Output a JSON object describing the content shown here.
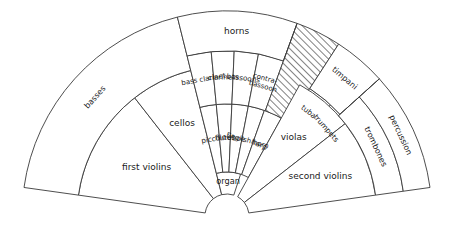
{
  "figure": {
    "type": "fan-diagram",
    "background_color": "#ffffff",
    "stroke_color": "#3a3a3a",
    "label_color": "#1a1a1a",
    "hatch_color": "#1a1a1a"
  },
  "geometry": {
    "center_x": 227,
    "center_y": 216,
    "inner_radius": 22,
    "outer_radius": 205,
    "start_angle_deg": 188,
    "end_angle_deg": 352
  },
  "sections": [
    {
      "name": "first-violins",
      "label": "first violins",
      "r0": 22,
      "r1": 150,
      "a0": 188,
      "a1": 232,
      "font_size": 9.0,
      "rotate": false,
      "hatched": false,
      "label_r": 0.56,
      "label_a": 0.52
    },
    {
      "name": "cellos",
      "label": "cellos",
      "r0": 22,
      "r1": 150,
      "a0": 232,
      "a1": 256,
      "font_size": 9.0,
      "rotate": false,
      "hatched": false,
      "label_r": 0.63,
      "label_a": 0.5
    },
    {
      "name": "basses",
      "label": "basses",
      "r0": 150,
      "r1": 205,
      "a0": 188,
      "a1": 256,
      "font_size": 8.0,
      "rotate": true,
      "hatched": false,
      "label_r": 0.5,
      "label_a": 0.5
    },
    {
      "name": "organ",
      "label": "organ",
      "r0": 22,
      "r1": 44,
      "a0": 256,
      "a1": 288,
      "font_size": 8.2,
      "rotate": false,
      "hatched": false,
      "label_r": 0.55,
      "label_a": 0.5
    },
    {
      "name": "piccolo",
      "label": "piccolo",
      "r0": 44,
      "r1": 112,
      "a0": 256,
      "a1": 264.5,
      "font_size": 7.2,
      "rotate": true,
      "hatched": false,
      "label_r": 0.5,
      "label_a": 0.5
    },
    {
      "name": "flutes",
      "label": "flutes",
      "r0": 44,
      "r1": 112,
      "a0": 264.5,
      "a1": 272.5,
      "font_size": 7.2,
      "rotate": true,
      "hatched": false,
      "label_r": 0.5,
      "label_a": 0.5
    },
    {
      "name": "oboe",
      "label": "oboe",
      "r0": 44,
      "r1": 112,
      "a0": 272.5,
      "a1": 281,
      "font_size": 7.2,
      "rotate": true,
      "hatched": false,
      "label_r": 0.5,
      "label_a": 0.5
    },
    {
      "name": "english-horn",
      "label": "English horn",
      "r0": 44,
      "r1": 112,
      "a0": 281,
      "a1": 289.5,
      "font_size": 7.0,
      "rotate": true,
      "hatched": false,
      "label_r": 0.5,
      "label_a": 0.5
    },
    {
      "name": "harp",
      "label": "harp",
      "r0": 44,
      "r1": 112,
      "a0": 289.5,
      "a1": 299,
      "font_size": 7.4,
      "rotate": true,
      "hatched": false,
      "label_r": 0.5,
      "label_a": 0.5
    },
    {
      "name": "bass-clarinet",
      "label": "bass clarinet",
      "r0": 112,
      "r1": 165,
      "a0": 256,
      "a1": 264.5,
      "font_size": 7.0,
      "rotate": true,
      "hatched": false,
      "label_r": 0.5,
      "label_a": 0.5
    },
    {
      "name": "clarinets",
      "label": "clarinets",
      "r0": 112,
      "r1": 165,
      "a0": 264.5,
      "a1": 272.5,
      "font_size": 7.2,
      "rotate": true,
      "hatched": false,
      "label_r": 0.5,
      "label_a": 0.5
    },
    {
      "name": "bassoons",
      "label": "bassoons",
      "r0": 112,
      "r1": 165,
      "a0": 272.5,
      "a1": 281,
      "font_size": 7.2,
      "rotate": true,
      "hatched": false,
      "label_r": 0.5,
      "label_a": 0.5
    },
    {
      "name": "contra-bassoon",
      "label": "contra-\nbassoon",
      "r0": 112,
      "r1": 165,
      "a0": 281,
      "a1": 290,
      "font_size": 7.0,
      "rotate": true,
      "hatched": false,
      "label_r": 0.5,
      "label_a": 0.5
    },
    {
      "name": "horns",
      "label": "horns",
      "r0": 165,
      "r1": 205,
      "a0": 256,
      "a1": 290,
      "font_size": 9.0,
      "rotate": false,
      "hatched": false,
      "label_r": 0.5,
      "label_a": 0.5
    },
    {
      "name": "hatched-area",
      "label": "",
      "r0": 112,
      "r1": 205,
      "a0": 290,
      "a1": 303,
      "font_size": 0,
      "rotate": false,
      "hatched": true,
      "label_r": 0.5,
      "label_a": 0.5
    },
    {
      "name": "tuba",
      "label": "tuba",
      "r0": 112,
      "r1": 152,
      "a0": 303,
      "a1": 313,
      "font_size": 7.4,
      "rotate": true,
      "hatched": false,
      "label_r": 0.5,
      "label_a": 0.5
    },
    {
      "name": "trumpets",
      "label": "trumpets",
      "r0": 112,
      "r1": 152,
      "a0": 313,
      "a1": 324,
      "font_size": 7.4,
      "rotate": true,
      "hatched": false,
      "label_r": 0.5,
      "label_a": 0.5
    },
    {
      "name": "timpani",
      "label": "timpani",
      "r0": 152,
      "r1": 205,
      "a0": 303,
      "a1": 318,
      "font_size": 8.0,
      "rotate": true,
      "hatched": false,
      "label_r": 0.55,
      "label_a": 0.5
    },
    {
      "name": "violas",
      "label": "violas",
      "r0": 22,
      "r1": 150,
      "a0": 299,
      "a1": 322,
      "font_size": 9.0,
      "rotate": false,
      "hatched": false,
      "label_r": 0.63,
      "label_a": 0.5
    },
    {
      "name": "second-violins",
      "label": "second violins",
      "r0": 22,
      "r1": 150,
      "a0": 322,
      "a1": 352,
      "font_size": 9.0,
      "rotate": false,
      "hatched": false,
      "label_r": 0.62,
      "label_a": 0.5
    },
    {
      "name": "trombones",
      "label": "trombones",
      "r0": 150,
      "r1": 178,
      "a0": 318,
      "a1": 352,
      "font_size": 8.0,
      "rotate": true,
      "hatched": false,
      "label_r": 0.5,
      "label_a": 0.5
    },
    {
      "name": "percussion",
      "label": "percussion",
      "r0": 178,
      "r1": 205,
      "a0": 318,
      "a1": 352,
      "font_size": 8.0,
      "rotate": true,
      "hatched": false,
      "label_r": 0.5,
      "label_a": 0.5
    }
  ],
  "extra_edges": [
    {
      "name": "horns-hatch-divider",
      "r0": 165,
      "r1": 205,
      "angle": 290
    },
    {
      "name": "timpani-trombone-divider",
      "r0": 150,
      "r1": 205,
      "angle": 318
    }
  ]
}
